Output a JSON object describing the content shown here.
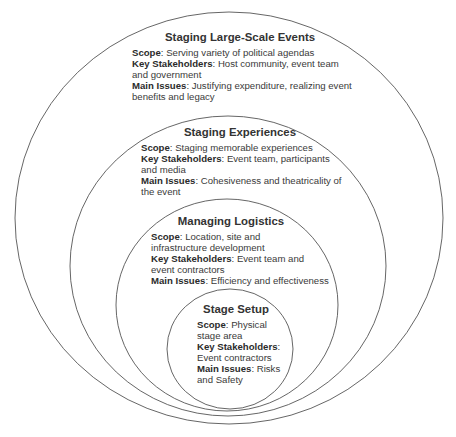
{
  "diagram": {
    "type": "nested-circles",
    "line_color": "#555555",
    "background": "#ffffff",
    "layers": [
      {
        "title": "Staging Large-Scale Events",
        "scope_label": "Scope",
        "scope": "Serving variety of political agendas",
        "stakeholders_label": "Key Stakeholders",
        "stakeholders": "Host community, event team and government",
        "issues_label": "Main Issues",
        "issues": "Justifying expenditure, realizing event benefits and legacy"
      },
      {
        "title": "Staging Experiences",
        "scope_label": "Scope",
        "scope": "Staging memorable experiences",
        "stakeholders_label": "Key Stakeholders",
        "stakeholders": "Event team, participants and media",
        "issues_label": "Main Issues",
        "issues": "Cohesiveness and theatricality of the event"
      },
      {
        "title": "Managing Logistics",
        "scope_label": "Scope",
        "scope": "Location, site and infrastructure development",
        "stakeholders_label": "Key Stakeholders",
        "stakeholders": "Event team and event contractors",
        "issues_label": "Main Issues",
        "issues": "Efficiency and effectiveness"
      },
      {
        "title": "Stage Setup",
        "scope_label": "Scope",
        "scope": "Physical stage area",
        "stakeholders_label": "Key Stakeholders",
        "stakeholders": "Event contractors",
        "issues_label": "Main Issues",
        "issues": "Risks and Safety"
      }
    ]
  }
}
